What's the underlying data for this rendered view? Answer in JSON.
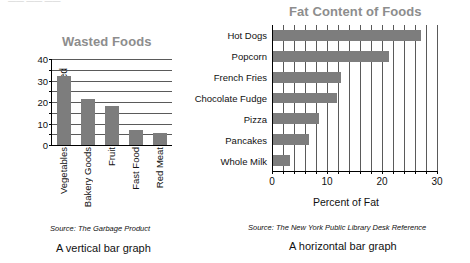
{
  "page": {
    "top_artifact_left": "—— —— ——",
    "top_artifact_right": "°"
  },
  "chart_data": [
    {
      "id": "wasted-foods",
      "type": "bar",
      "orientation": "vertical",
      "title": "Wasted Foods",
      "xlabel": "",
      "ylabel": "Percent Wasted",
      "categories": [
        "Vegetables",
        "Bakery Goods",
        "Fruit",
        "Fast Food",
        "Red Meat"
      ],
      "values": [
        32,
        21.5,
        18,
        7,
        5.5
      ],
      "ylim": [
        0,
        40
      ],
      "yticks": [
        0,
        10,
        20,
        30,
        40
      ],
      "minor_tick_step": 5,
      "grid": true,
      "grid_axis": "y",
      "source": "Source: The Garbage Product",
      "caption": "A vertical bar graph",
      "bar_color": "#7d7d7d",
      "title_color": "#8d8d8d"
    },
    {
      "id": "fat-content-of-foods",
      "type": "bar",
      "orientation": "horizontal",
      "title": "Fat Content of Foods",
      "xlabel": "Percent of Fat",
      "ylabel": "",
      "categories": [
        "Hot Dogs",
        "Popcorn",
        "French Fries",
        "Chocolate Fudge",
        "Pizza",
        "Pancakes",
        "Whole Milk"
      ],
      "values": [
        27,
        21.2,
        12.5,
        11.8,
        8.5,
        6.8,
        3.2
      ],
      "xlim": [
        0,
        30
      ],
      "xticks": [
        0,
        10,
        20,
        30
      ],
      "minor_tick_step": 2,
      "grid": true,
      "grid_axis": "x",
      "source": "Source: The New York Public Library Desk Reference",
      "caption": "A horizontal bar graph",
      "bar_color": "#7d7d7d",
      "title_color": "#8d8d8d"
    }
  ]
}
